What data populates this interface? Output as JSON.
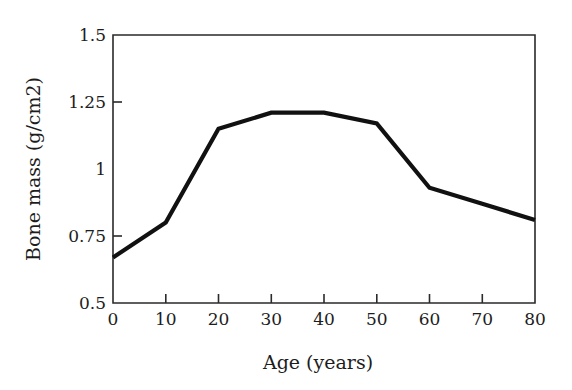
{
  "chart_data": {
    "type": "line",
    "title": "",
    "xlabel": "Age (years)",
    "ylabel": "Bone mass (g/cm2)",
    "x": [
      0,
      10,
      20,
      30,
      40,
      50,
      60,
      70,
      80
    ],
    "values": [
      0.67,
      0.8,
      1.15,
      1.21,
      1.21,
      1.17,
      0.93,
      0.87,
      0.81
    ],
    "series": [
      {
        "name": "Bone mass",
        "values": [
          0.67,
          0.8,
          1.15,
          1.21,
          1.21,
          1.17,
          0.93,
          0.87,
          0.81
        ],
        "color": "#111111"
      }
    ],
    "xlim": [
      0,
      80
    ],
    "ylim": [
      0.5,
      1.5
    ],
    "xticks": [
      0,
      10,
      20,
      30,
      40,
      50,
      60,
      70,
      80
    ],
    "xtick_labels": [
      "0",
      "10",
      "20",
      "30",
      "40",
      "50",
      "60",
      "70",
      "80"
    ],
    "yticks": [
      0.5,
      0.75,
      1.0,
      1.25,
      1.5
    ],
    "ytick_labels": [
      "0.5",
      "0.75",
      "1",
      "1.25",
      "1.5"
    ],
    "grid": false,
    "legend": "none",
    "line_color": "#111111",
    "axis_color": "#2a2a2a",
    "background": "#ffffff"
  }
}
